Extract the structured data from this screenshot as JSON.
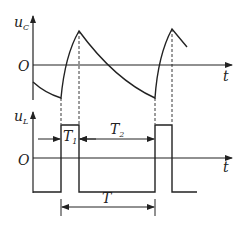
{
  "top_plot": {
    "y_label": "u",
    "y_label_sub": "C",
    "origin_label": "O",
    "x_label": "t",
    "waveform": "capacitor voltage: exponential charge/discharge, alternating rise to peak and decay",
    "points": [
      [
        33,
        82
      ],
      [
        61,
        98
      ],
      [
        79,
        31
      ],
      [
        155,
        98
      ],
      [
        172,
        29
      ],
      [
        187,
        47
      ]
    ]
  },
  "bottom_plot": {
    "y_label": "u",
    "y_label_sub": "L",
    "origin_label": "O",
    "x_label": "t",
    "waveform": "rectangular pulse train",
    "high_level_y": 125,
    "low_level_y": 192,
    "pulses": [
      [
        61,
        79
      ],
      [
        155,
        172
      ]
    ]
  },
  "annotations": {
    "T1": {
      "label": "T",
      "sub": "1"
    },
    "T2": {
      "label": "T",
      "sub": "2"
    },
    "T": {
      "label": "T"
    }
  },
  "colors": {
    "line": "#222222",
    "background": "#ffffff"
  }
}
